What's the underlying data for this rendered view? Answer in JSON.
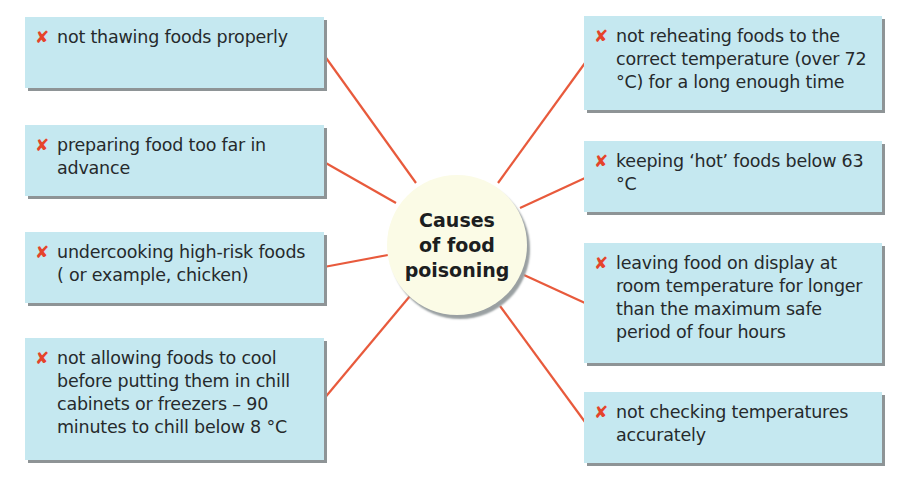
{
  "diagram": {
    "type": "spider-diagram",
    "colors": {
      "box_fill": "#c5e8f0",
      "box_shadow": "#8e9496",
      "connector": "#e85a3c",
      "cross": "#e5432a",
      "hub_fill": "#fbfbe6",
      "text": "#262a2c"
    },
    "center": {
      "title": "Causes of food poisoning",
      "lines": [
        "Causes",
        "of food",
        "poisoning"
      ]
    },
    "marker_glyph": "✘",
    "left_items": [
      {
        "text": "not thawing foods properly"
      },
      {
        "text": "preparing food too far in advance"
      },
      {
        "text": "undercooking high-risk foods ( or example, chicken)"
      },
      {
        "text": "not allowing foods to cool before putting them in chill cabinets or freezers – 90 minutes to chill below 8 °C"
      }
    ],
    "right_items": [
      {
        "text": "not reheating foods to the correct temperature (over 72 °C) for a long enough time"
      },
      {
        "text": "keeping ‘hot’ foods below 63 °C"
      },
      {
        "text": "leaving food on display at room temperature for longer than the maximum safe period of four hours"
      },
      {
        "text": "not checking temperatures accurately"
      }
    ]
  }
}
